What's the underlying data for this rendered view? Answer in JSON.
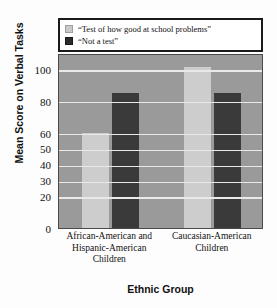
{
  "chart_data": {
    "type": "bar",
    "title": "",
    "xlabel": "Ethnic Group",
    "ylabel": "Mean Score on Verbal Tasks",
    "categories": [
      "African-American and Hispanic-American Children",
      "Caucasian-American Children"
    ],
    "category_lines": [
      [
        "African-American and",
        "Hispanic-American",
        "Children"
      ],
      [
        "Caucasian-American",
        "Children"
      ]
    ],
    "series": [
      {
        "name": "“Test of how good at school problems”",
        "color": "#cdcdcd",
        "values": [
          60,
          101
        ]
      },
      {
        "name": "“Not a test”",
        "color": "#3a3a3a",
        "values": [
          85,
          85
        ]
      }
    ],
    "ylim": [
      0,
      110
    ],
    "ytick_labels": [
      "100",
      "80",
      "60",
      "50",
      "40",
      "30",
      "20",
      "0"
    ],
    "ytick_values": [
      100,
      80,
      60,
      50,
      40,
      30,
      20,
      0
    ],
    "grid": true,
    "gridline_color": "#e9e9e9",
    "plot_background": "#9a9a9a",
    "legend_position": "above-plot"
  },
  "legend": {
    "items": [
      {
        "label": "“Test of how good at school problems”",
        "swatch": "light"
      },
      {
        "label": "“Not a test”",
        "swatch": "dark"
      }
    ]
  },
  "axes": {
    "y_title": "Mean Score on Verbal Tasks",
    "x_title": "Ethnic Group"
  }
}
